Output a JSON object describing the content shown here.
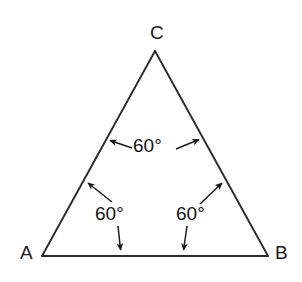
{
  "figure": {
    "type": "geometry-diagram",
    "shape": "equilateral-triangle",
    "background_color": "#ffffff",
    "stroke_color": "#2b2b2b",
    "text_color": "#141414",
    "vertices": [
      {
        "name": "A",
        "label": "A",
        "x": 42,
        "y": 256
      },
      {
        "name": "B",
        "label": "B",
        "x": 268,
        "y": 256
      },
      {
        "name": "C",
        "label": "C",
        "x": 155,
        "y": 51
      }
    ],
    "edges": [
      {
        "name": "side-AB",
        "from": "A",
        "to": "B"
      },
      {
        "name": "side-BC",
        "from": "B",
        "to": "C"
      },
      {
        "name": "side-CA",
        "from": "C",
        "to": "A"
      }
    ],
    "angle_annotations": [
      {
        "name": "angle-at-C",
        "label": "60°",
        "vertex": "C",
        "label_x": 155,
        "label_y": 145,
        "arrows": [
          {
            "name": "arrow-to-side-CA",
            "x1": 135,
            "y1": 149,
            "x2": 108,
            "y2": 140
          },
          {
            "name": "arrow-to-side-CB",
            "x1": 176,
            "y1": 149,
            "x2": 201,
            "y2": 139
          }
        ]
      },
      {
        "name": "angle-at-A",
        "label": "60°",
        "vertex": "A",
        "label_x": 116,
        "label_y": 213,
        "arrows": [
          {
            "name": "arrow-to-side-AC",
            "x1": 112,
            "y1": 202,
            "x2": 86,
            "y2": 181
          },
          {
            "name": "arrow-to-side-AB",
            "x1": 118,
            "y1": 226,
            "x2": 121,
            "y2": 252
          }
        ]
      },
      {
        "name": "angle-at-B",
        "label": "60°",
        "vertex": "B",
        "label_x": 196,
        "label_y": 213,
        "arrows": [
          {
            "name": "arrow-to-side-BC",
            "x1": 199,
            "y1": 205,
            "x2": 224,
            "y2": 181
          },
          {
            "name": "arrow-to-side-BA",
            "x1": 187,
            "y1": 226,
            "x2": 183,
            "y2": 252
          }
        ]
      }
    ],
    "labels": {
      "vertex_a": "A",
      "vertex_b": "B",
      "vertex_c": "C",
      "angle_top": "60°",
      "angle_left": "60°",
      "angle_right": "60°"
    }
  }
}
